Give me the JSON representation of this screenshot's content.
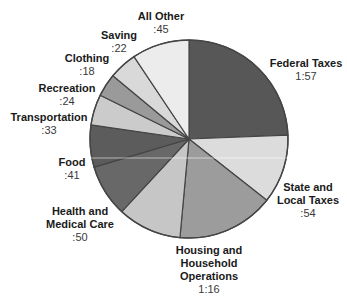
{
  "chart_data": {
    "type": "pie",
    "title": "",
    "unit": "minutes of an 8-hour workday",
    "start": "12 o'clock",
    "direction": "clockwise",
    "slices": [
      {
        "name": "Federal Taxes",
        "label_lines": [
          "Federal Taxes"
        ],
        "value_label": "1:57",
        "minutes": 117,
        "color": "#575757"
      },
      {
        "name": "State and Local Taxes",
        "label_lines": [
          "State and",
          "Local Taxes"
        ],
        "value_label": ":54",
        "minutes": 54,
        "color": "#dcdcdc"
      },
      {
        "name": "Housing and Household Operations",
        "label_lines": [
          "Housing and",
          "Household",
          "Operations"
        ],
        "value_label": "1:16",
        "minutes": 76,
        "color": "#9c9c9c"
      },
      {
        "name": "Health and Medical Care",
        "label_lines": [
          "Health and",
          "Medical Care"
        ],
        "value_label": ":50",
        "minutes": 50,
        "color": "#c6c6c6"
      },
      {
        "name": "Food",
        "label_lines": [
          "Food"
        ],
        "value_label": ":41",
        "minutes": 41,
        "color": "#686868"
      },
      {
        "name": "Transportation",
        "label_lines": [
          "Transportation"
        ],
        "value_label": ":33",
        "minutes": 33,
        "color": "#5c5c5c"
      },
      {
        "name": "Recreation",
        "label_lines": [
          "Recreation"
        ],
        "value_label": ":24",
        "minutes": 24,
        "color": "#cbcbcb"
      },
      {
        "name": "Clothing",
        "label_lines": [
          "Clothing"
        ],
        "value_label": ":18",
        "minutes": 18,
        "color": "#9a9a9a"
      },
      {
        "name": "Saving",
        "label_lines": [
          "Saving"
        ],
        "value_label": ":22",
        "minutes": 22,
        "color": "#d9d9d9"
      },
      {
        "name": "All Other",
        "label_lines": [
          "All Other"
        ],
        "value_label": ":45",
        "minutes": 45,
        "color": "#ececec"
      }
    ],
    "legend": "none",
    "edge_color": "#454545"
  }
}
